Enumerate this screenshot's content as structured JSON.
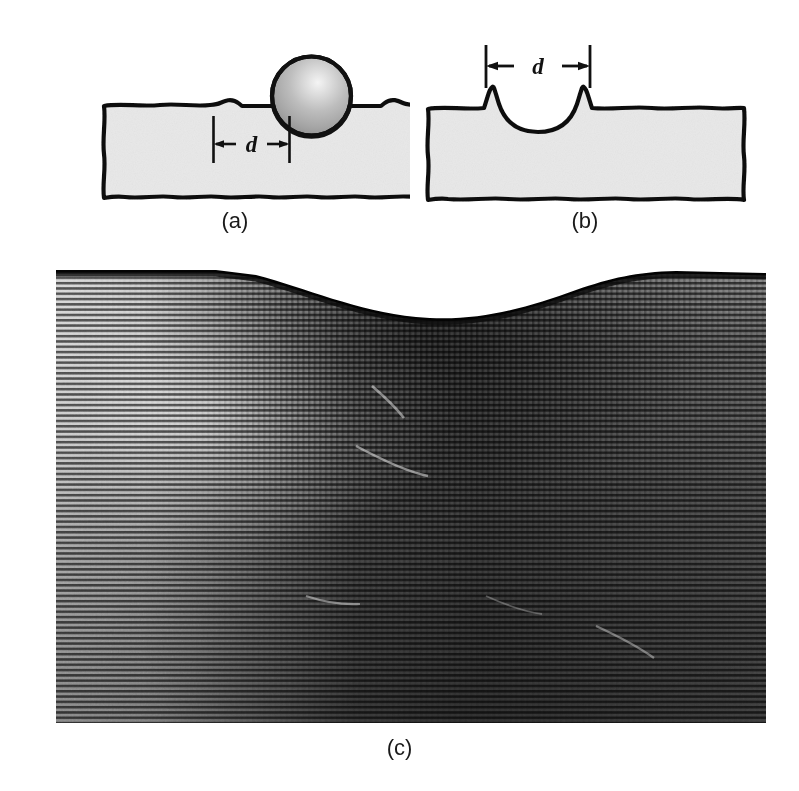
{
  "figure": {
    "kind": "brinell-hardness-indentation-figure",
    "background_color": "#ffffff",
    "panels": [
      {
        "id": "a",
        "caption": "(a)",
        "description": "Spherical indenter resting on a metal specimen, indentation diameter marked d",
        "dimension_symbol": "d",
        "block_fill_color": "#e9e9e9",
        "outline_color": "#111111",
        "sphere": {
          "name": "spherical-indenter",
          "highlight_color": "#f2f2f2",
          "mid_color": "#b4b4b4",
          "edge_color": "#8c8c8c",
          "outline_color": "#111111"
        }
      },
      {
        "id": "b",
        "caption": "(b)",
        "description": "Residual spherical indentation crater left in the specimen surface, diameter d",
        "dimension_symbol": "d",
        "block_fill_color": "#e9e9e9",
        "outline_color": "#111111"
      },
      {
        "id": "c",
        "caption": "(c)",
        "description": "Photomicrograph cross-section through a Brinell indentation showing the depressed surface profile and deformed subsurface material",
        "image_style": "halftone line-screen black-and-white photomicrograph",
        "dark_tone": "#1b1b1b",
        "light_tone": "#d8d8d8"
      }
    ]
  },
  "captions": {
    "a": "(a)",
    "b": "(b)",
    "c": "(c)"
  },
  "labels": {
    "diameter_a": "d",
    "diameter_b": "d"
  }
}
